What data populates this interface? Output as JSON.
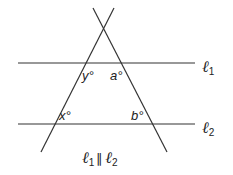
{
  "diagram": {
    "type": "geometry",
    "colors": {
      "line": "#333333",
      "text": "#222222",
      "background": "#ffffff"
    },
    "lines": {
      "l1": {
        "label": "ℓ",
        "subscript": "1"
      },
      "l2": {
        "label": "ℓ",
        "subscript": "2"
      }
    },
    "angles": {
      "y": "y°",
      "a": "a°",
      "x": "x°",
      "b": "b°"
    },
    "caption": {
      "l1": "ℓ",
      "l1_sub": "1",
      "parallel": "∥",
      "l2": "ℓ",
      "l2_sub": "2"
    }
  }
}
